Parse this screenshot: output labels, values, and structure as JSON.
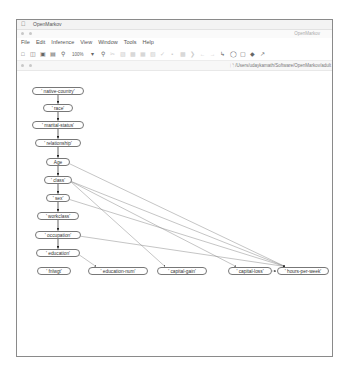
{
  "app": {
    "name": "OpenMarkov",
    "frame_title": "OpenMarkov"
  },
  "menu": [
    "File",
    "Edit",
    "Inference",
    "View",
    "Window",
    "Tools",
    "Help"
  ],
  "toolbar": {
    "zoom_level": "100%",
    "icons": [
      "new-file-icon",
      "open-folder-icon",
      "save-icon",
      "save-as-icon",
      "zoom-out-icon",
      "zoom-in-icon",
      "cut-icon",
      "copy-icon",
      "paste-icon",
      "undo-icon",
      "redo-icon",
      "select-icon",
      "chance-node-icon",
      "decision-node-icon",
      "utility-node-icon",
      "link-icon"
    ]
  },
  "network_window": {
    "path": "/Users/udaykamath/Software/OpenMarkov/adult"
  },
  "nodes": [
    {
      "id": "native-country",
      "label": "' native-country'",
      "x": 58,
      "y": 91,
      "w": 52
    },
    {
      "id": "race",
      "label": "' race'",
      "x": 58,
      "y": 108,
      "w": 30
    },
    {
      "id": "marital-status",
      "label": "' marital-status'",
      "x": 58,
      "y": 125,
      "w": 52
    },
    {
      "id": "relationship",
      "label": "' relationship'",
      "x": 58,
      "y": 143,
      "w": 46
    },
    {
      "id": "age",
      "label": "Age",
      "x": 58,
      "y": 162,
      "w": 24
    },
    {
      "id": "class",
      "label": "' class'",
      "x": 58,
      "y": 180,
      "w": 28
    },
    {
      "id": "sex",
      "label": "' sex'",
      "x": 58,
      "y": 198,
      "w": 24
    },
    {
      "id": "workclass",
      "label": "' workclass'",
      "x": 58,
      "y": 216,
      "w": 42
    },
    {
      "id": "occupation",
      "label": "' occupation'",
      "x": 58,
      "y": 235,
      "w": 46
    },
    {
      "id": "education",
      "label": "' education'",
      "x": 58,
      "y": 253,
      "w": 44
    },
    {
      "id": "fnlwgt",
      "label": "' fnlwgt'",
      "x": 54,
      "y": 271,
      "w": 34
    },
    {
      "id": "education-num",
      "label": "' education-num'",
      "x": 118,
      "y": 271,
      "w": 60
    },
    {
      "id": "capital-gain",
      "label": "' capital-gain'",
      "x": 182,
      "y": 271,
      "w": 50
    },
    {
      "id": "capital-loss",
      "label": "' capital-loss'",
      "x": 250,
      "y": 271,
      "w": 44
    },
    {
      "id": "hours-per-week",
      "label": "' hours-per-week'",
      "x": 303,
      "y": 271,
      "w": 52
    }
  ],
  "edges": [
    [
      "native-country",
      "race"
    ],
    [
      "race",
      "marital-status"
    ],
    [
      "marital-status",
      "relationship"
    ],
    [
      "relationship",
      "age"
    ],
    [
      "age",
      "class"
    ],
    [
      "class",
      "sex"
    ],
    [
      "sex",
      "workclass"
    ],
    [
      "workclass",
      "occupation"
    ],
    [
      "occupation",
      "education"
    ],
    [
      "education",
      "education-num"
    ],
    [
      "age",
      "hours-per-week"
    ],
    [
      "class",
      "capital-gain"
    ],
    [
      "class",
      "capital-loss"
    ],
    [
      "class",
      "hours-per-week"
    ],
    [
      "sex",
      "hours-per-week"
    ],
    [
      "occupation",
      "hours-per-week"
    ],
    [
      "capital-loss",
      "hours-per-week"
    ]
  ]
}
